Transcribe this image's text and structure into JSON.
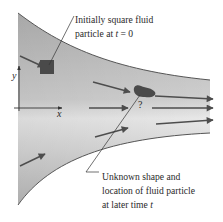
{
  "figure": {
    "type": "fluid-flow-diagram",
    "colors": {
      "channel_fill_dark": "#b4b4b4",
      "channel_fill_light": "#e6e6e6",
      "boundary": "#555555",
      "particle": "#4a4a4a",
      "arrow": "#4d4d4d",
      "text": "#2a2a2a"
    },
    "axes": {
      "x_label": "x",
      "y_label": "y"
    },
    "annotations": {
      "initial": {
        "line1": "Initially square fluid",
        "line2_prefix": "particle at ",
        "line2_var": "t",
        "line2_suffix": " = 0"
      },
      "later": {
        "line1": "Unknown shape and",
        "line2": "location of fluid particle",
        "line3_prefix": "at later time ",
        "line3_var": "t"
      },
      "question_mark": "?"
    },
    "arrows_count": 8
  }
}
